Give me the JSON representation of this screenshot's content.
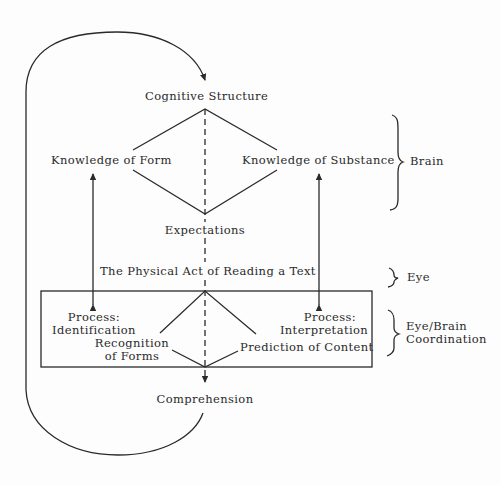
{
  "diagram": {
    "nodes": {
      "cognitive_structure": "Cognitive Structure",
      "knowledge_of_form": "Knowledge of Form",
      "knowledge_of_substance": "Knowledge of Substance",
      "expectations": "Expectations",
      "physical_act": "The Physical Act of Reading a Text",
      "process_identification_line1": "Process:",
      "process_identification_line2": "Identification",
      "process_interpretation_line1": "Process:",
      "process_interpretation_line2": "Interpretation",
      "recognition_line1": "Recognition",
      "recognition_line2": "of Forms",
      "prediction": "Prediction of Content",
      "comprehension": "Comprehension"
    },
    "brackets": {
      "brain": "Brain",
      "eye": "Eye",
      "eye_brain_line1": "Eye/Brain",
      "eye_brain_line2": "Coordination"
    },
    "colors": {
      "ink": "#2a2a2a",
      "background": "#fdfdfd"
    }
  }
}
